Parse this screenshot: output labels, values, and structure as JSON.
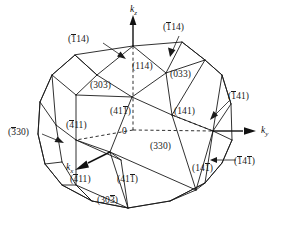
{
  "figure": {
    "type": "crystallographic-polyhedron-diagram",
    "background_color": "#ffffff",
    "line_color": "#1a1a1a"
  },
  "axes": [
    {
      "id": "kz",
      "label_plain": "kz",
      "base": "k",
      "sub": "z",
      "x": 133,
      "y": 9,
      "direction": "up"
    },
    {
      "id": "ky",
      "label_plain": "ky",
      "base": "k",
      "sub": "y",
      "x": 263,
      "y": 133,
      "direction": "right"
    },
    {
      "id": "kx",
      "label_plain": "kx",
      "base": "k",
      "sub": "x",
      "x": 70,
      "y": 168,
      "direction": "lower-left"
    }
  ],
  "origin": {
    "label": "0",
    "x": 124,
    "y": 129
  },
  "labels": [
    {
      "id": "l-114-upper-left",
      "open": "(",
      "close": ")",
      "parts": [
        {
          "t": "1",
          "bar": true
        },
        {
          "t": "14",
          "bar": false
        }
      ],
      "plain": "(-114)",
      "x": 76,
      "y": 38,
      "leader": true
    },
    {
      "id": "l-114-upper-right",
      "open": "(",
      "close": ")",
      "parts": [
        {
          "t": "1",
          "bar": true
        },
        {
          "t": "14",
          "bar": false
        }
      ],
      "plain": "(-114)",
      "x": 168,
      "y": 26,
      "leader": true
    },
    {
      "id": "l-114-center",
      "open": "(",
      "close": ")",
      "parts": [
        {
          "t": "114",
          "bar": false
        }
      ],
      "plain": "(114)",
      "x": 140,
      "y": 66,
      "leader": false
    },
    {
      "id": "l-033",
      "open": "(",
      "close": ")",
      "parts": [
        {
          "t": "033",
          "bar": false
        }
      ],
      "plain": "(033)",
      "x": 175,
      "y": 73,
      "leader": false
    },
    {
      "id": "l-303-upper",
      "open": "(",
      "close": ")",
      "parts": [
        {
          "t": "303",
          "bar": false
        }
      ],
      "plain": "(303)",
      "x": 95,
      "y": 84,
      "leader": false
    },
    {
      "id": "l-411-upper",
      "open": "(",
      "close": ")",
      "parts": [
        {
          "t": "41",
          "bar": false
        },
        {
          "t": "1",
          "bar": true
        }
      ],
      "plain": "(41-1)",
      "x": 115,
      "y": 110,
      "leader": false
    },
    {
      "id": "l-141-right-upper",
      "open": "(",
      "close": ")",
      "parts": [
        {
          "t": "141",
          "bar": false
        }
      ],
      "plain": "(141)",
      "x": 178,
      "y": 110,
      "leader": false
    },
    {
      "id": "l-141-far-right",
      "open": "(",
      "close": ")",
      "parts": [
        {
          "t": "1",
          "bar": true
        },
        {
          "t": "41",
          "bar": false
        }
      ],
      "plain": "(-141)",
      "x": 232,
      "y": 94,
      "leader": true
    },
    {
      "id": "l-330-left",
      "open": "(",
      "close": ")",
      "parts": [
        {
          "t": "3",
          "bar": true
        },
        {
          "t": "30",
          "bar": false
        }
      ],
      "plain": "(-330)",
      "x": 12,
      "y": 129,
      "leader": true
    },
    {
      "id": "l-411-left",
      "open": "(",
      "close": ")",
      "parts": [
        {
          "t": "4",
          "bar": true
        },
        {
          "t": "11",
          "bar": false
        }
      ],
      "plain": "(-411)",
      "x": 71,
      "y": 122,
      "leader": false
    },
    {
      "id": "l-330-center",
      "open": "(",
      "close": ")",
      "parts": [
        {
          "t": "330",
          "bar": false
        }
      ],
      "plain": "(330)",
      "x": 155,
      "y": 145,
      "leader": false
    },
    {
      "id": "l-141-bar-right",
      "open": "(",
      "close": ")",
      "parts": [
        {
          "t": "1",
          "bar": true
        },
        {
          "t": "4",
          "bar": false
        },
        {
          "t": "1",
          "bar": true
        }
      ],
      "plain": "(-14-1)",
      "x": 238,
      "y": 158,
      "leader": true
    },
    {
      "id": "l-141-lower-right",
      "open": "(",
      "close": ")",
      "parts": [
        {
          "t": "14",
          "bar": false
        },
        {
          "t": "1",
          "bar": true
        }
      ],
      "plain": "(14-1)",
      "x": 196,
      "y": 165,
      "leader": false
    },
    {
      "id": "l-411-lower-left",
      "open": "(",
      "close": ")",
      "parts": [
        {
          "t": "4",
          "bar": true
        },
        {
          "t": "11",
          "bar": false
        }
      ],
      "plain": "(-411)",
      "x": 74,
      "y": 176,
      "leader": false
    },
    {
      "id": "l-411-lower-mid",
      "open": "(",
      "close": ")",
      "parts": [
        {
          "t": "41",
          "bar": false
        },
        {
          "t": "1",
          "bar": true
        }
      ],
      "plain": "(41-1)",
      "x": 122,
      "y": 176,
      "leader": false
    },
    {
      "id": "l-303-bottom",
      "open": "(",
      "close": ")",
      "parts": [
        {
          "t": "30",
          "bar": false
        },
        {
          "t": "3",
          "bar": true
        }
      ],
      "plain": "(30-3)",
      "x": 101,
      "y": 197,
      "leader": false
    }
  ]
}
